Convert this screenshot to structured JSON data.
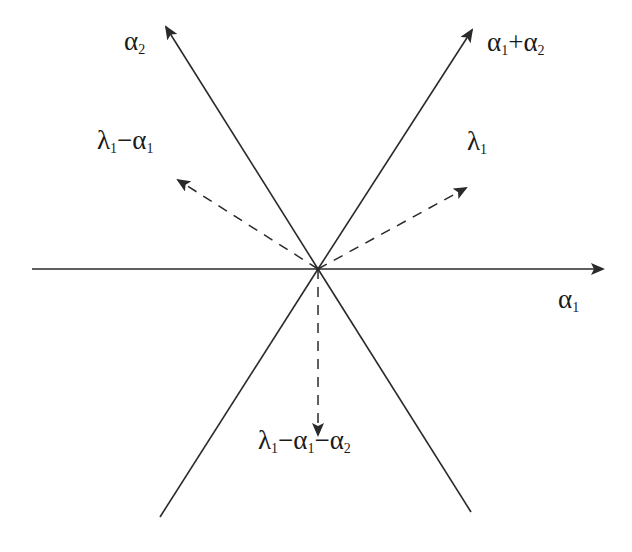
{
  "diagram": {
    "type": "root-system-weight-diagram",
    "origin": {
      "x": 318,
      "y": 269
    },
    "colors": {
      "line": "#2a2a2a",
      "text": "#1a1a1a",
      "background": "#ffffff"
    },
    "solid_lines": [
      {
        "id": "axis-alpha1",
        "from": [
          32,
          269
        ],
        "to": [
          603,
          269
        ],
        "arrow": true,
        "label_ref": "alpha1"
      },
      {
        "id": "root-alpha2",
        "from": [
          318,
          269
        ],
        "to": [
          166,
          27
        ],
        "arrow": true,
        "label_ref": "alpha2"
      },
      {
        "id": "root-alpha1-plus-alpha2",
        "from": [
          318,
          269
        ],
        "to": [
          472,
          30
        ],
        "arrow": true,
        "label_ref": "alpha1_plus_alpha2"
      },
      {
        "id": "root-neg-alpha1-plus-alpha2",
        "from": [
          318,
          269
        ],
        "to": [
          160,
          517
        ],
        "arrow": false
      },
      {
        "id": "root-neg-alpha2",
        "from": [
          318,
          269
        ],
        "to": [
          471,
          512
        ],
        "arrow": false
      }
    ],
    "dashed_arrows": [
      {
        "id": "weight-lambda1",
        "from": [
          318,
          269
        ],
        "to": [
          466,
          188
        ],
        "label_ref": "lambda1"
      },
      {
        "id": "weight-lambda1-minus-alpha1",
        "from": [
          318,
          269
        ],
        "to": [
          178,
          180
        ],
        "label_ref": "lambda1_minus_alpha1"
      },
      {
        "id": "weight-lambda1-minus-alpha1-minus-alpha2",
        "from": [
          318,
          269
        ],
        "to": [
          318,
          435
        ],
        "label_ref": "lambda1_minus_alpha1_minus_alpha2"
      }
    ],
    "labels": {
      "alpha1": {
        "parts": [
          {
            "t": "α",
            "sub": "1"
          }
        ],
        "x": 558,
        "y": 306
      },
      "alpha2": {
        "parts": [
          {
            "t": "α",
            "sub": "2"
          }
        ],
        "x": 124,
        "y": 48
      },
      "alpha1_plus_alpha2": {
        "parts": [
          {
            "t": "α",
            "sub": "1"
          },
          {
            "t": "+α",
            "sub": "2"
          }
        ],
        "x": 487,
        "y": 49
      },
      "lambda1": {
        "parts": [
          {
            "t": "λ",
            "sub": "1"
          }
        ],
        "x": 467,
        "y": 148
      },
      "lambda1_minus_alpha1": {
        "parts": [
          {
            "t": "λ",
            "sub": "1"
          },
          {
            "t": "−α",
            "sub": "1"
          }
        ],
        "x": 97,
        "y": 147
      },
      "lambda1_minus_alpha1_minus_alpha2": {
        "parts": [
          {
            "t": "λ",
            "sub": "1"
          },
          {
            "t": "−α",
            "sub": "1"
          },
          {
            "t": "−α",
            "sub": "2"
          }
        ],
        "x": 258,
        "y": 447
      }
    }
  }
}
